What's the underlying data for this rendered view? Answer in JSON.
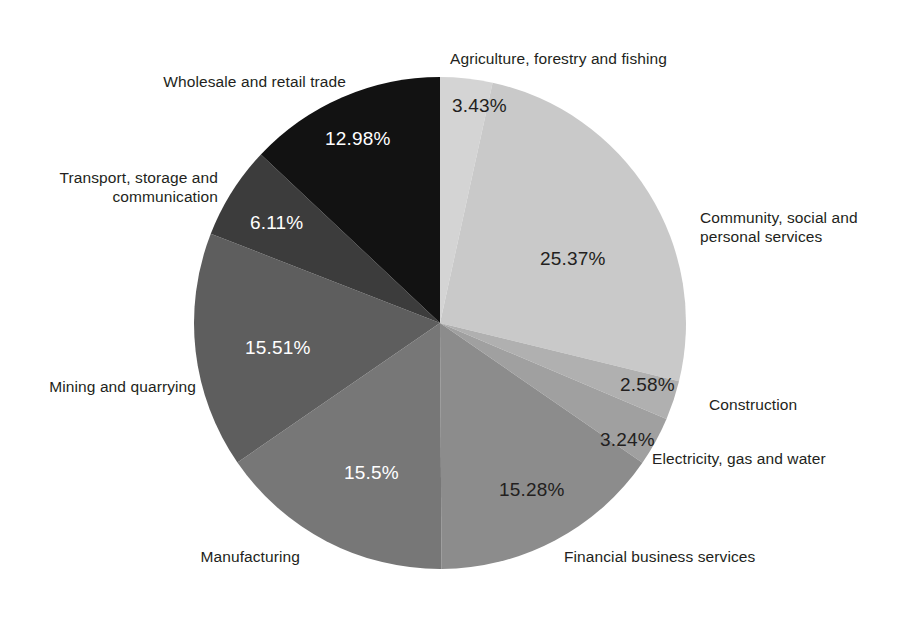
{
  "chart_data": {
    "type": "pie",
    "title": "",
    "subtitle": "",
    "xlabel": "",
    "ylabel": "",
    "legend_position": "none",
    "grid": false,
    "units": "percent",
    "start_angle_deg": 0,
    "direction": "clockwise",
    "categories": [
      "Agriculture, forestry and fishing",
      "Community, social and personal services",
      "Construction",
      "Electricity, gas and water",
      "Financial business services",
      "Manufacturing",
      "Mining and quarrying",
      "Transport, storage and communication",
      "Wholesale and retail trade"
    ],
    "values": [
      3.43,
      25.37,
      2.58,
      3.24,
      15.28,
      15.5,
      15.51,
      6.11,
      12.98
    ],
    "value_labels": [
      "3.43%",
      "25.37%",
      "2.58%",
      "3.24%",
      "15.28%",
      "15.5%",
      "15.51%",
      "6.11%",
      "12.98%"
    ],
    "colors": [
      "#d4d4d4",
      "#c9c9c9",
      "#b0b0b0",
      "#a0a0a0",
      "#8c8c8c",
      "#777777",
      "#5e5e5e",
      "#3c3c3c",
      "#121212"
    ],
    "slices": [
      {
        "name": "Agriculture, forestry and fishing",
        "value": 3.43,
        "value_label": "3.43%",
        "label": "Agriculture, forestry and fishing",
        "color": "#d4d4d4",
        "label_color": "#231f20",
        "value_label_color": "#231f20"
      },
      {
        "name": "Community, social and personal services",
        "value": 25.37,
        "value_label": "25.37%",
        "label": "Community, social and\npersonal services",
        "color": "#c9c9c9",
        "label_color": "#231f20",
        "value_label_color": "#231f20"
      },
      {
        "name": "Construction",
        "value": 2.58,
        "value_label": "2.58%",
        "label": "Construction",
        "color": "#b0b0b0",
        "label_color": "#231f20",
        "value_label_color": "#231f20"
      },
      {
        "name": "Electricity, gas and water",
        "value": 3.24,
        "value_label": "3.24%",
        "label": "Electricity, gas and water",
        "color": "#a0a0a0",
        "label_color": "#231f20",
        "value_label_color": "#231f20"
      },
      {
        "name": "Financial business services",
        "value": 15.28,
        "value_label": "15.28%",
        "label": "Financial business services",
        "color": "#8c8c8c",
        "label_color": "#231f20",
        "value_label_color": "#231f20"
      },
      {
        "name": "Manufacturing",
        "value": 15.5,
        "value_label": "15.5%",
        "label": "Manufacturing",
        "color": "#777777",
        "label_color": "#231f20",
        "value_label_color": "#ffffff"
      },
      {
        "name": "Mining and quarrying",
        "value": 15.51,
        "value_label": "15.51%",
        "label": "Mining and quarrying",
        "color": "#5e5e5e",
        "label_color": "#231f20",
        "value_label_color": "#ffffff"
      },
      {
        "name": "Transport, storage and communication",
        "value": 6.11,
        "value_label": "6.11%",
        "label": "Transport, storage and\ncommunication",
        "color": "#3c3c3c",
        "label_color": "#231f20",
        "value_label_color": "#ffffff"
      },
      {
        "name": "Wholesale and retail trade",
        "value": 12.98,
        "value_label": "12.98%",
        "label": "Wholesale and retail trade",
        "color": "#121212",
        "label_color": "#231f20",
        "value_label_color": "#ffffff"
      }
    ]
  },
  "geometry": {
    "center_x": 440,
    "center_y": 323,
    "radius": 246,
    "background": "#ffffff"
  }
}
